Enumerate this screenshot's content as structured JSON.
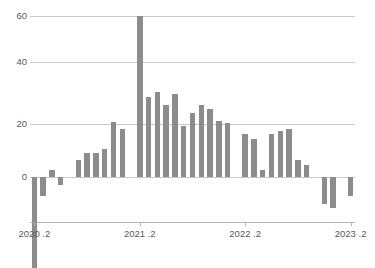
{
  "chart_data": {
    "type": "bar",
    "title": "",
    "subtitle": "",
    "xlabel": "",
    "ylabel": "",
    "ylim": [
      -36,
      62
    ],
    "yticks": [
      0,
      20,
      40,
      60
    ],
    "ytick_labels": [
      "0",
      "20",
      "40",
      "60"
    ],
    "grid": true,
    "legend": false,
    "legend_position": "none",
    "bar_color": "#8c8c8c",
    "gridline_color": "#c9c9c9",
    "axis_color": "#b5b5b5",
    "tick_label_color": "#58595b",
    "xtick_labels": [
      "2020 .2",
      "2021 .2",
      "2022 .2",
      "2023 .2"
    ],
    "xtick_indices": [
      0,
      12,
      24,
      36
    ],
    "categories": [
      "2020.2",
      "2020.3",
      "2020.4",
      "2020.5",
      "2020.6",
      "2020.7",
      "2020.8",
      "2020.9",
      "2020.10",
      "2020.11",
      "2020.12",
      "2021.1",
      "2021.2",
      "2021.3",
      "2021.4",
      "2021.5",
      "2021.6",
      "2021.7",
      "2021.8",
      "2021.9",
      "2021.10",
      "2021.11",
      "2021.12",
      "2022.1",
      "2022.2",
      "2022.3",
      "2022.4",
      "2022.5",
      "2022.6",
      "2022.7",
      "2022.8",
      "2022.9",
      "2022.10",
      "2022.11",
      "2022.12",
      "2023.1",
      "2023.2"
    ],
    "values": [
      -34,
      -7,
      2.5,
      -3,
      0,
      6.5,
      9,
      9,
      10.5,
      20.5,
      18,
      0,
      60,
      30,
      31.5,
      27,
      31,
      19,
      24,
      27,
      25.5,
      21,
      20,
      0,
      16,
      14,
      2.5,
      16,
      17,
      18,
      6.5,
      4.5,
      0,
      -10,
      -11.5,
      0,
      -7
    ]
  }
}
